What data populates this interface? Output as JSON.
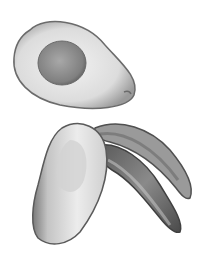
{
  "image": {
    "description": "Grayscale photograph of avocado pieces on white background",
    "subjects": [
      "avocado-half-with-pit",
      "avocado-quarter-without-pit",
      "avocado-skin-slices"
    ],
    "colors": {
      "background": "#ffffff",
      "flesh_light": "#e8e8e8",
      "flesh_mid": "#bdbdbd",
      "skin_dark": "#4a4a4a",
      "pit": "#8c8c8c"
    }
  }
}
